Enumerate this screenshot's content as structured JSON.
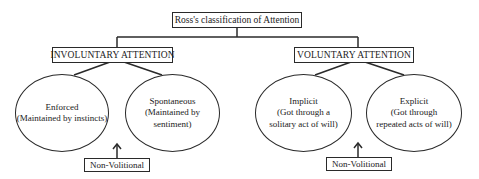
{
  "diagram": {
    "title": "Ross's classification of Attention",
    "categories": [
      {
        "label": "INVOLUNTARY ATTENTION",
        "children": [
          {
            "name": "Enforced",
            "lines": [
              "Enforced",
              "(Maintained by instincts)"
            ]
          },
          {
            "name": "Spontaneous",
            "lines": [
              "Spontaneous",
              "(Maintained by",
              "sentiment)"
            ]
          }
        ],
        "annotation": "Non-Volitional"
      },
      {
        "label": "VOLUNTARY ATTENTION",
        "children": [
          {
            "name": "Implicit",
            "lines": [
              "Implicit",
              "(Got through a",
              "solitary act of will)"
            ]
          },
          {
            "name": "Explicit",
            "lines": [
              "Explicit",
              "(Got through",
              "repeated acts of will)"
            ]
          }
        ],
        "annotation": "Non-Volitional"
      }
    ],
    "colors": {
      "stroke": "#2a2a2a",
      "text": "#222222",
      "background": "#ffffff"
    }
  }
}
